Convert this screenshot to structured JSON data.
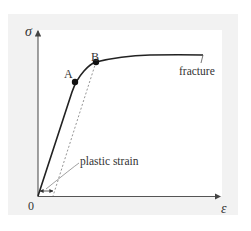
{
  "diagram": {
    "type": "stress-strain curve",
    "y_axis_label": "σ",
    "x_axis_label": "ε",
    "origin_label": "0",
    "points": [
      {
        "label": "A"
      },
      {
        "label": "B"
      }
    ],
    "annotations": {
      "fracture": "fracture",
      "plastic_strain": "plastic strain"
    },
    "colors": {
      "panel": "#f2f2f2",
      "plot_background": "#ffffff",
      "curve": "#222222",
      "axis": "#555555",
      "dashed_line": "#888888",
      "text": "#333333"
    }
  }
}
